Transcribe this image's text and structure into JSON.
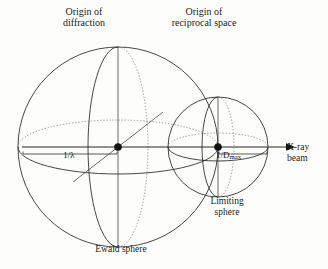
{
  "figure": {
    "background_color": "#fdfdfc",
    "line_color": "#262626",
    "dotted_line_color": "#7a7a7a"
  },
  "labels": {
    "origin_diffraction_line1": "Origin of",
    "origin_diffraction_line2": "diffraction",
    "origin_reciprocal_line1": "Origin of",
    "origin_reciprocal_line2": "reciprocal space",
    "ewald_sphere": "Ewald sphere",
    "limiting_sphere_line1": "Limiting",
    "limiting_sphere_line2": "sphere",
    "xray_beam_line1": "X-ray",
    "xray_beam_line2": "beam",
    "radius_ewald": "1/λ",
    "radius_limiting_base": "1/D",
    "radius_limiting_sub": "max"
  },
  "geometry": {
    "ewald_sphere": {
      "center_x": 118,
      "center_y": 147,
      "radius": 100,
      "equator_ry": 27,
      "meridian_rx": 30
    },
    "limiting_sphere": {
      "center_x": 218,
      "center_y": 147,
      "radius": 50,
      "equator_ry": 14,
      "meridian_rx": 16
    },
    "beam_axis": {
      "x_start": 22,
      "x_end": 290,
      "y": 147
    },
    "bracket_ewald": {
      "x_start": 23,
      "x_end": 117,
      "y": 152
    },
    "bracket_limiting": {
      "x_start": 219,
      "x_end": 267,
      "y": 152
    }
  }
}
